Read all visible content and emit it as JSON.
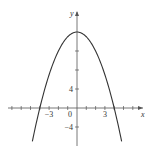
{
  "chart_data": {
    "type": "line",
    "title": "",
    "function": "y = 16 - x^2",
    "xlabel": "x",
    "ylabel": "y",
    "xlim": [
      -8,
      7.5
    ],
    "ylim": [
      -7.5,
      19
    ],
    "x_tick_step": 1,
    "y_tick_step": 4,
    "x_tick_labels": [
      {
        "value": -3,
        "text": "−3"
      },
      {
        "value": 0,
        "text": "0"
      },
      {
        "value": 3,
        "text": "3"
      }
    ],
    "y_tick_labels": [
      {
        "value": 4,
        "text": "4"
      },
      {
        "value": -4,
        "text": "−4"
      }
    ],
    "series": [
      {
        "name": "parabola",
        "x": [
          -4.8,
          -4,
          -3,
          -2,
          -1,
          0,
          1,
          2,
          3,
          4,
          4.8
        ],
        "y": [
          -7.04,
          0,
          7,
          12,
          15,
          16,
          15,
          12,
          7,
          0,
          -7.04
        ]
      }
    ],
    "grid": false,
    "legend": null
  },
  "colors": {
    "axis": "#555555",
    "curve": "#333333"
  }
}
